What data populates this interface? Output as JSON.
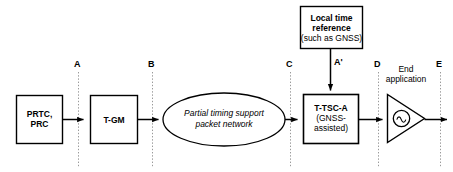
{
  "diagram": {
    "colors": {
      "stroke": "#000000",
      "dashed": "#9a9a9a",
      "background": "#ffffff"
    },
    "nodes": [
      {
        "id": "prtc",
        "shape": "rect",
        "lines": [
          {
            "text": "PRTC,",
            "bold": true
          },
          {
            "text": "PRC",
            "bold": true
          }
        ]
      },
      {
        "id": "tgm",
        "shape": "rect",
        "lines": [
          {
            "text": "T-GM",
            "bold": true
          }
        ]
      },
      {
        "id": "network",
        "shape": "ellipse",
        "lines": [
          {
            "text": "Partial timing support",
            "bold": false
          },
          {
            "text": "packet network",
            "bold": false
          }
        ]
      },
      {
        "id": "ttsca",
        "shape": "rect",
        "lines": [
          {
            "text": "T-TSC-A",
            "bold": true
          },
          {
            "text": "(GNSS-",
            "bold": false
          },
          {
            "text": "assisted)",
            "bold": false
          }
        ]
      },
      {
        "id": "localtime",
        "shape": "rect",
        "lines": [
          {
            "text": "Local time",
            "bold": true
          },
          {
            "text": "reference",
            "bold": true
          },
          {
            "text": "(such as GNSS)",
            "bold": false
          }
        ]
      },
      {
        "id": "endapp",
        "shape": "triangle",
        "lines": [
          {
            "text": "End",
            "bold": false
          },
          {
            "text": "application",
            "bold": false
          }
        ]
      }
    ],
    "reference_points": [
      {
        "id": "A",
        "label": "A"
      },
      {
        "id": "B",
        "label": "B"
      },
      {
        "id": "C",
        "label": "C"
      },
      {
        "id": "Aprime",
        "label": "A'"
      },
      {
        "id": "D",
        "label": "D"
      },
      {
        "id": "E",
        "label": "E"
      }
    ]
  }
}
